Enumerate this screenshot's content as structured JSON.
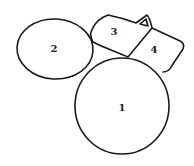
{
  "diagram": {
    "type": "region-map",
    "regions": [
      {
        "id": "1",
        "label": "1",
        "shape": "circle"
      },
      {
        "id": "2",
        "label": "2",
        "shape": "ellipse"
      },
      {
        "id": "3",
        "label": "3",
        "shape": "polygon"
      },
      {
        "id": "4",
        "label": "4",
        "shape": "polygon"
      }
    ],
    "markers": [
      {
        "shape": "triangle",
        "location": "top-right corner of region 3"
      }
    ],
    "stroke_color": "#1a1a1a",
    "background": "#ffffff"
  }
}
